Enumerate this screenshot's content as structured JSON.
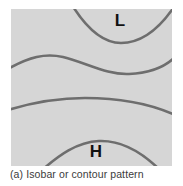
{
  "figure": {
    "caption": "(a) Isobar or contour pattern",
    "panel": {
      "background_color": "#d6d6d6",
      "width": 161,
      "height": 157
    },
    "line_color": "#6e6e6e",
    "label_color": "#111111"
  },
  "labels": {
    "low": "L",
    "high": "H"
  },
  "chart_data": {
    "type": "line",
    "title": "(a) Isobar or contour pattern",
    "xlabel": "",
    "ylabel": "",
    "grid": false,
    "legend": "none",
    "annotations": [
      {
        "text": "L",
        "x": 109,
        "y": 17,
        "meaning": "low-pressure-center"
      },
      {
        "text": "H",
        "x": 85,
        "y": 148,
        "meaning": "high-pressure-center"
      }
    ],
    "series": [
      {
        "name": "isobar-1-low-trough",
        "path": "M 61,-4 C 76,20 92,34 110,34 C 130,34 148,20 163,-2"
      },
      {
        "name": "isobar-2-wave",
        "path": "M -3,60 C 18,48 34,44 52,48 C 76,54 96,66 118,65 C 140,64 154,58 164,48"
      },
      {
        "name": "isobar-3-broad-arc",
        "path": "M -3,101 C 20,94 46,89 74,89 C 110,89 142,96 164,106"
      },
      {
        "name": "isobar-4-high-ridge",
        "path": "M 30,162 C 48,146 66,133 88,132 C 112,131 132,144 150,162"
      }
    ]
  }
}
